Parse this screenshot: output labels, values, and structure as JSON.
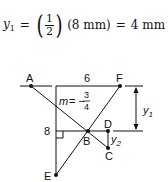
{
  "equation": {
    "lhs_var": "y",
    "lhs_sub": "1",
    "equals1": "=",
    "frac_num": "1",
    "frac_den": "2",
    "middle": "(8 mm)",
    "equals2": "=",
    "result": "4 mm"
  },
  "diagram": {
    "points": {
      "A": "A",
      "B": "B",
      "C": "C",
      "D": "D",
      "E": "E",
      "F": "F"
    },
    "dimensions": {
      "top_length": "6",
      "left_length": "8",
      "y1_var": "y",
      "y1_sub": "1",
      "y2_var": "y",
      "y2_sub": "2"
    },
    "slope": {
      "var": "m",
      "equals": "= −",
      "num": "3",
      "den": "4"
    }
  }
}
